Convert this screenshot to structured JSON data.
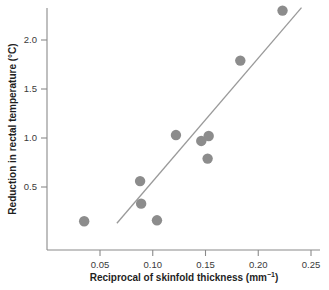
{
  "chart_data": {
    "type": "scatter",
    "title": "",
    "xlabel": "Reciprocal of skinfold thickness (mm⁻¹)",
    "ylabel": "Reduction in rectal temperature (°C)",
    "xlim": [
      0.0,
      0.262
    ],
    "ylim": [
      0.0,
      2.42
    ],
    "grid": false,
    "legend": null,
    "xticks": [
      0.05,
      0.1,
      0.15,
      0.2,
      0.25
    ],
    "xtick_labels": [
      "0.05",
      "0.10",
      "0.15",
      "0.20",
      "0.25"
    ],
    "yticks": [
      0.5,
      1.0,
      1.5,
      2.0
    ],
    "ytick_labels": [
      "0.5",
      "1.0",
      "1.5",
      "2.0"
    ],
    "marker_color": "#8c8c8c",
    "marker_size": 5.2,
    "axis_color": "#8a8a8a",
    "series": [
      {
        "name": "observations",
        "x": [
          0.035,
          0.088,
          0.089,
          0.104,
          0.122,
          0.146,
          0.152,
          0.153,
          0.183,
          0.223
        ],
        "y": [
          0.15,
          0.56,
          0.33,
          0.16,
          1.03,
          0.97,
          0.79,
          1.02,
          1.79,
          2.3
        ]
      }
    ],
    "fit_line": {
      "name": "regression-line",
      "color": "#9a9a9a",
      "x_start": 0.066,
      "y_start": 0.13,
      "x_end": 0.241,
      "y_end": 2.33
    }
  },
  "axis_titles": {
    "x_prefix": "Reciprocal of skinfold thickness (mm",
    "x_superscript": "−1",
    "x_suffix": ")",
    "y": "Reduction in rectal temperature (°C)"
  }
}
